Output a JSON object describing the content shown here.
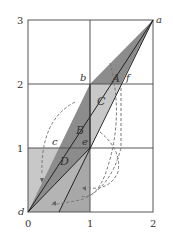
{
  "diagram": {
    "type": "phase-space map diagram",
    "x_ticks": [
      "0",
      "1",
      "2"
    ],
    "y_ticks": [
      "0",
      "1",
      "2",
      "3"
    ],
    "point_labels": {
      "a": "a",
      "b": "b",
      "c": "c",
      "d": "d",
      "e": "e",
      "f": "f"
    },
    "region_labels": {
      "A": "A",
      "B": "B",
      "C": "C",
      "D": "D"
    },
    "points": {
      "a": [
        2,
        3
      ],
      "b": [
        1,
        2
      ],
      "c": [
        0.5,
        1
      ],
      "d": [
        0,
        0
      ],
      "e": [
        1,
        1
      ],
      "f": [
        1.5,
        2
      ]
    },
    "colors": {
      "grid": "#555555",
      "dark_fill": "#8c8c8c",
      "mid_fill": "#a8a8a8",
      "light_fill": "#c8c8c8",
      "dashed_arrows": "#777777"
    }
  }
}
